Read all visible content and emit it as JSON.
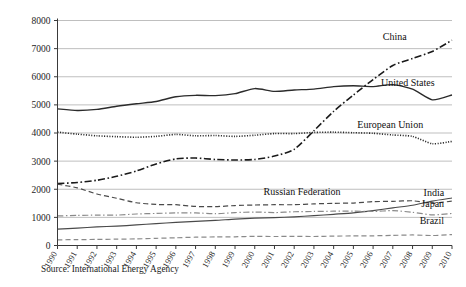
{
  "source_note": "Source: International Energy Agency",
  "chart_data": {
    "type": "line",
    "title": "",
    "subtitle": "",
    "xlabel": "",
    "ylabel": "",
    "grid": true,
    "legend_position": "right-inline-labels",
    "xlim": [
      1990,
      2010
    ],
    "ylim": [
      0,
      8000
    ],
    "ytick_step": 1000,
    "x": [
      1990,
      1991,
      1992,
      1993,
      1994,
      1995,
      1996,
      1997,
      1998,
      1999,
      2000,
      2001,
      2002,
      2003,
      2004,
      2005,
      2006,
      2007,
      2008,
      2009,
      2010
    ],
    "xtick_labels": [
      "1990",
      "1991",
      "1992",
      "1993",
      "1994",
      "1995",
      "1996",
      "1997",
      "1998",
      "1999",
      "2000",
      "2001",
      "2002",
      "2003",
      "2004",
      "2005",
      "2006",
      "2007",
      "2008",
      "2009",
      "2010"
    ],
    "ytick_labels": [
      "0",
      "1000",
      "2000",
      "3000",
      "4000",
      "5000",
      "6000",
      "7000",
      "8000"
    ],
    "ytick_values": [
      0,
      1000,
      2000,
      3000,
      4000,
      5000,
      6000,
      7000,
      8000
    ],
    "series": [
      {
        "name": "China",
        "label": "China",
        "style": "dash-dot",
        "color": "#1a1a1a",
        "width": 1.6,
        "dasharray": "7,2.5,1.6,2.5",
        "label_x": 2007.1,
        "label_y": 7430,
        "label_anchor": "middle",
        "values": [
          2200,
          2240,
          2320,
          2460,
          2650,
          2900,
          3080,
          3110,
          3060,
          3040,
          3060,
          3180,
          3420,
          4080,
          4770,
          5350,
          5900,
          6400,
          6650,
          6900,
          7300
        ]
      },
      {
        "name": "United States",
        "label": "United States",
        "style": "solid",
        "color": "#2b2b2b",
        "width": 1.35,
        "dasharray": "",
        "label_x": 2006.4,
        "label_y": 5810,
        "label_anchor": "start",
        "values": [
          4860,
          4800,
          4840,
          4950,
          5040,
          5120,
          5290,
          5340,
          5330,
          5400,
          5580,
          5480,
          5530,
          5560,
          5650,
          5680,
          5650,
          5720,
          5560,
          5180,
          5350
        ]
      },
      {
        "name": "European Union",
        "label": "European Union",
        "style": "dotted",
        "color": "#2b2b2b",
        "width": 1.6,
        "dasharray": "1.1,1.5",
        "label_x": 2005.2,
        "label_y": 4320,
        "label_anchor": "start",
        "values": [
          4030,
          3960,
          3900,
          3870,
          3850,
          3880,
          3950,
          3900,
          3910,
          3880,
          3920,
          3980,
          3980,
          4020,
          4030,
          4010,
          3990,
          3930,
          3880,
          3620,
          3700
        ]
      },
      {
        "name": "Russian Federation",
        "label": "Russian Federation",
        "style": "dashed",
        "color": "#4a4a4a",
        "width": 1.2,
        "dasharray": "5,3",
        "label_x": 2002.4,
        "label_y": 1930,
        "label_anchor": "middle",
        "values": [
          2180,
          2050,
          1830,
          1680,
          1520,
          1460,
          1450,
          1390,
          1380,
          1420,
          1440,
          1450,
          1450,
          1480,
          1500,
          1510,
          1560,
          1570,
          1590,
          1500,
          1580
        ]
      },
      {
        "name": "India",
        "label": "India",
        "style": "solid",
        "color": "#4a4a4a",
        "width": 1.2,
        "dasharray": "",
        "label_x": 2009.6,
        "label_y": 1870,
        "label_anchor": "end",
        "values": [
          580,
          620,
          660,
          690,
          730,
          780,
          820,
          860,
          890,
          940,
          970,
          990,
          1020,
          1060,
          1110,
          1160,
          1240,
          1340,
          1430,
          1580,
          1690
        ]
      },
      {
        "name": "Japan",
        "label": "Japan",
        "style": "dash-dot",
        "color": "#8a8a8a",
        "width": 1.2,
        "dasharray": "6,2.5,1.4,2.5",
        "label_x": 2009.6,
        "label_y": 1480,
        "label_anchor": "end",
        "values": [
          1050,
          1070,
          1080,
          1080,
          1120,
          1140,
          1160,
          1160,
          1130,
          1170,
          1190,
          1170,
          1200,
          1210,
          1220,
          1220,
          1210,
          1240,
          1180,
          1090,
          1140
        ]
      },
      {
        "name": "Brazil",
        "label": "Brazil",
        "style": "dashed",
        "color": "#8a8a8a",
        "width": 1.2,
        "dasharray": "5,3",
        "label_x": 2009.6,
        "label_y": 880,
        "label_anchor": "end",
        "values": [
          200,
          210,
          215,
          225,
          235,
          255,
          275,
          295,
          305,
          310,
          325,
          320,
          325,
          320,
          335,
          340,
          345,
          360,
          375,
          355,
          390
        ]
      }
    ]
  }
}
